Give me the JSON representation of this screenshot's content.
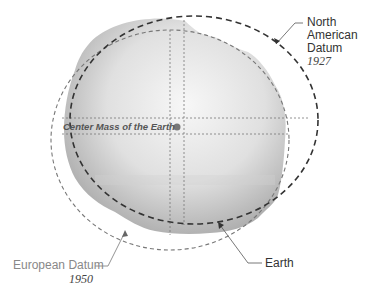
{
  "diagram": {
    "labels": {
      "north_american_datum": {
        "line1": "North",
        "line2": "American",
        "line3": "Datum",
        "year": "1927"
      },
      "european_datum": {
        "name": "European Datum",
        "year": "1950"
      },
      "earth": "Earth",
      "center_mass": "Center Mass of the Earth"
    },
    "colors": {
      "earth_fill_light": "#f2f2f2",
      "earth_fill_dark": "#b8b8b8",
      "nad_ellipse": "#333333",
      "european_ellipse": "#777777",
      "center_dot": "#777777",
      "label_text": "#333333",
      "european_label_text": "#888888"
    }
  }
}
